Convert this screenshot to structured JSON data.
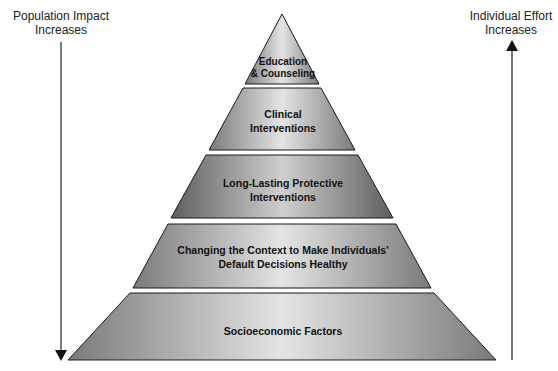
{
  "diagram": {
    "type": "pyramid",
    "left_axis": {
      "label_line1": "Population Impact",
      "label_line2": "Increases",
      "direction": "down"
    },
    "right_axis": {
      "label_line1": "Individual Effort",
      "label_line2": "Increases",
      "direction": "up"
    },
    "tiers": [
      {
        "line1": "Education",
        "line2": "& Counseling"
      },
      {
        "line1": "Clinical",
        "line2": "Interventions"
      },
      {
        "line1": "Long-Lasting Protective",
        "line2": "Interventions"
      },
      {
        "line1": "Changing the Context to Make Individuals'",
        "line2": "Default Decisions Healthy"
      },
      {
        "line1": "Socioeconomic Factors",
        "line2": ""
      }
    ],
    "colors": {
      "tier_edge": "#7a7a7a",
      "tier_center": "#e6e6e6",
      "outline": "#1a1a1a"
    }
  }
}
